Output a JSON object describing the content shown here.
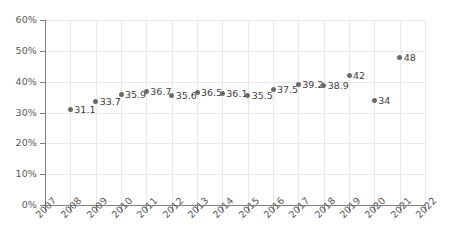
{
  "chart_data": {
    "type": "scatter",
    "title": "",
    "xlabel": "",
    "ylabel": "",
    "grid": true,
    "legend": false,
    "x_axis": {
      "ticks": [
        "2007",
        "2008",
        "2009",
        "2010",
        "2011",
        "2012",
        "2013",
        "2014",
        "2015",
        "2016",
        "2017",
        "2018",
        "2019",
        "2020",
        "2021",
        "2022"
      ],
      "min": 2007,
      "max": 2022,
      "rotated_labels": true
    },
    "y_axis": {
      "ticks": [
        "0%",
        "10%",
        "20%",
        "30%",
        "40%",
        "50%",
        "60%"
      ],
      "tick_values": [
        0,
        10,
        20,
        30,
        40,
        50,
        60
      ],
      "min": 0,
      "max": 60,
      "unit": "%"
    },
    "series": [
      {
        "name": "",
        "marker_color": "#6b6b6b",
        "points": [
          {
            "x": "2008",
            "y": 31.1,
            "label": "31.1"
          },
          {
            "x": "2009",
            "y": 33.7,
            "label": "33.7"
          },
          {
            "x": "2010",
            "y": 35.9,
            "label": "35.9"
          },
          {
            "x": "2011",
            "y": 36.7,
            "label": "36.7"
          },
          {
            "x": "2012",
            "y": 35.6,
            "label": "35.6"
          },
          {
            "x": "2013",
            "y": 36.5,
            "label": "36.5"
          },
          {
            "x": "2014",
            "y": 36.1,
            "label": "36.1"
          },
          {
            "x": "2015",
            "y": 35.5,
            "label": "35.5"
          },
          {
            "x": "2016",
            "y": 37.5,
            "label": "37.5"
          },
          {
            "x": "2017",
            "y": 39.2,
            "label": "39.2"
          },
          {
            "x": "2018",
            "y": 38.9,
            "label": "38.9"
          },
          {
            "x": "2019",
            "y": 42,
            "label": "42"
          },
          {
            "x": "2020",
            "y": 34,
            "label": "34"
          },
          {
            "x": "2021",
            "y": 48,
            "label": "48"
          }
        ]
      }
    ],
    "colors": {
      "marker": "#6b6b6b",
      "gridline": "#e8e8e8",
      "axis": "#808080",
      "tick_text": "#58595b",
      "data_label": "#414042",
      "background": "#ffffff"
    }
  }
}
